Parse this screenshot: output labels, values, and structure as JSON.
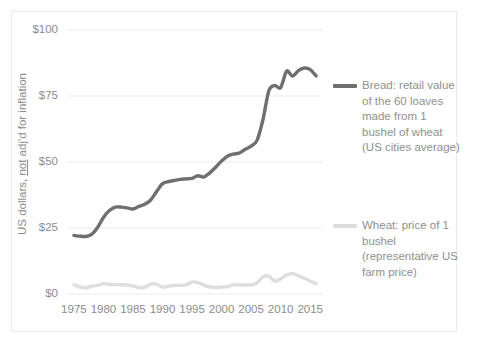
{
  "chart_data": {
    "type": "line",
    "title": "",
    "xlabel": "",
    "ylabel": "US dollars, not adj'd for inflation",
    "ylabel_parts": {
      "before": "US dollars, ",
      "underlined": "not",
      "after": " adj'd for inflation"
    },
    "xlim": [
      1974,
      2017
    ],
    "ylim": [
      0,
      100
    ],
    "y_ticks": [
      0,
      25,
      50,
      75,
      100
    ],
    "y_tick_labels": [
      "$0",
      "$25",
      "$50",
      "$75",
      "$100"
    ],
    "x_ticks": [
      1975,
      1980,
      1985,
      1990,
      1995,
      2000,
      2005,
      2010,
      2015
    ],
    "x_tick_labels": [
      "1975",
      "1980",
      "1985",
      "1990",
      "1995",
      "2000",
      "2005",
      "2010",
      "2015"
    ],
    "grid": "horizontal",
    "legend_position": "right",
    "colors": {
      "bread": "#6f6f6f",
      "wheat": "#dedede",
      "grid": "#f2f2f2",
      "axis_text": "#8c8c8c",
      "frame": "#e9eaec"
    },
    "x": [
      1975,
      1976,
      1977,
      1978,
      1979,
      1980,
      1981,
      1982,
      1983,
      1984,
      1985,
      1986,
      1987,
      1988,
      1989,
      1990,
      1991,
      1992,
      1993,
      1994,
      1995,
      1996,
      1997,
      1998,
      1999,
      2000,
      2001,
      2002,
      2003,
      2004,
      2005,
      2006,
      2007,
      2008,
      2009,
      2010,
      2011,
      2012,
      2013,
      2014,
      2015,
      2016
    ],
    "series": [
      {
        "name": "Bread: retail value of the 60 loaves made from 1 bushel of wheat (US cities average)",
        "short_name": "bread",
        "color": "#6f6f6f",
        "values": [
          22.2,
          21.9,
          21.8,
          22.6,
          25.2,
          29.0,
          31.6,
          32.9,
          32.9,
          32.6,
          32.2,
          33.2,
          34.0,
          35.6,
          38.8,
          41.8,
          42.6,
          43.0,
          43.4,
          43.6,
          43.8,
          44.8,
          44.3,
          45.9,
          48.0,
          50.4,
          52.2,
          53.0,
          53.4,
          54.8,
          56.0,
          58.2,
          66.0,
          77.0,
          79.0,
          78.2,
          84.4,
          82.6,
          84.6,
          85.6,
          85.0,
          82.6
        ]
      },
      {
        "name": "Wheat: price of 1 bushel (representative US farm price)",
        "short_name": "wheat",
        "color": "#dedede",
        "values": [
          3.55,
          2.73,
          2.33,
          2.97,
          3.29,
          3.91,
          3.65,
          3.55,
          3.53,
          3.39,
          3.08,
          2.42,
          2.57,
          3.72,
          3.72,
          2.61,
          3.0,
          3.24,
          3.26,
          3.45,
          4.55,
          4.3,
          3.38,
          2.65,
          2.48,
          2.62,
          2.78,
          3.56,
          3.4,
          3.4,
          3.42,
          4.26,
          6.48,
          6.78,
          4.87,
          5.7,
          7.24,
          7.77,
          6.87,
          5.99,
          4.89,
          3.89
        ]
      }
    ]
  },
  "legend": {
    "bread": {
      "lines": [
        "Bread: retail value",
        "of the 60 loaves",
        "made from 1",
        "bushel of wheat",
        "(US cities average)"
      ]
    },
    "wheat": {
      "lines": [
        "Wheat: price of 1",
        "bushel",
        "(representative US",
        "farm price)"
      ]
    }
  }
}
